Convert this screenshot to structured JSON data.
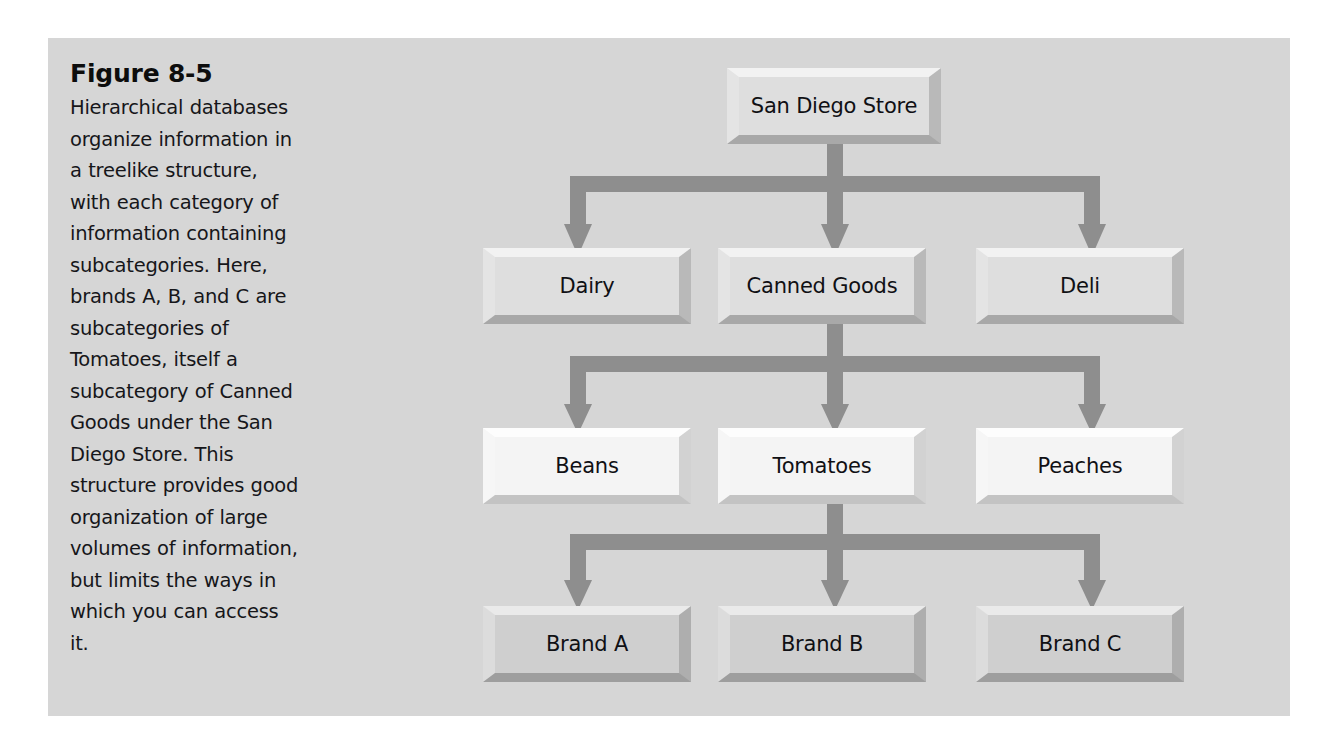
{
  "figure": {
    "title": "Figure 8-5",
    "caption": "Hierarchical databases organize information in a treelike structure, with each category of information containing subcategories. Here, brands A, B, and C are subcategories of Tomatoes, itself a subcategory of Canned Goods under the San Diego Store. This structure provides good organization of large volumes of information, but limits the ways in which you can access it."
  },
  "colors": {
    "page_background": "#ffffff",
    "panel_background": "#d6d6d6",
    "connector": "#8e8e8e",
    "node_face_level1": "#dedede",
    "node_face_level2": "#dedede",
    "node_face_level3": "#f4f4f4",
    "node_face_level4": "#cfcfcf",
    "node_shadow": "#b2b2b2",
    "text": "#101014"
  },
  "diagram": {
    "type": "hierarchy-tree",
    "levels": [
      {
        "level": 1,
        "nodes": [
          {
            "id": "san-diego-store",
            "label": "San Diego Store"
          }
        ]
      },
      {
        "level": 2,
        "nodes": [
          {
            "id": "dairy",
            "label": "Dairy"
          },
          {
            "id": "canned-goods",
            "label": "Canned Goods"
          },
          {
            "id": "deli",
            "label": "Deli"
          }
        ]
      },
      {
        "level": 3,
        "nodes": [
          {
            "id": "beans",
            "label": "Beans"
          },
          {
            "id": "tomatoes",
            "label": "Tomatoes"
          },
          {
            "id": "peaches",
            "label": "Peaches"
          }
        ]
      },
      {
        "level": 4,
        "nodes": [
          {
            "id": "brand-a",
            "label": "Brand A"
          },
          {
            "id": "brand-b",
            "label": "Brand B"
          },
          {
            "id": "brand-c",
            "label": "Brand C"
          }
        ]
      }
    ],
    "edges": [
      {
        "from": "san-diego-store",
        "to": "dairy"
      },
      {
        "from": "san-diego-store",
        "to": "canned-goods"
      },
      {
        "from": "san-diego-store",
        "to": "deli"
      },
      {
        "from": "canned-goods",
        "to": "beans"
      },
      {
        "from": "canned-goods",
        "to": "tomatoes"
      },
      {
        "from": "canned-goods",
        "to": "peaches"
      },
      {
        "from": "tomatoes",
        "to": "brand-a"
      },
      {
        "from": "tomatoes",
        "to": "brand-b"
      },
      {
        "from": "tomatoes",
        "to": "brand-c"
      }
    ]
  }
}
